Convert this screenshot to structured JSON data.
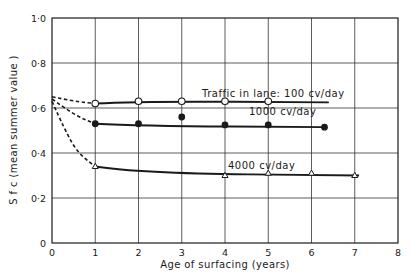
{
  "chart_data": {
    "type": "line",
    "title": "",
    "xlabel": "Age of surfacing (years)",
    "ylabel": "S f c (mean summer value )",
    "xlim": [
      0,
      8
    ],
    "ylim": [
      0,
      1.0
    ],
    "grid": true,
    "x_ticks": [
      "0",
      "1",
      "2",
      "3",
      "4",
      "5",
      "6",
      "7",
      "8"
    ],
    "y_ticks": [
      "0",
      "0·2",
      "0·4",
      "0·6",
      "0·8",
      "1·0"
    ],
    "legend": "none (inline annotations)",
    "series": [
      {
        "name": "Traffic in lane: 100 cv/day",
        "marker": "open-circle",
        "extrapolated_dashed": [
          [
            0,
            0.65
          ],
          [
            0.5,
            0.63
          ],
          [
            1,
            0.62
          ]
        ],
        "fitted_line": [
          [
            1,
            0.62
          ],
          [
            2,
            0.63
          ],
          [
            6.4,
            0.625
          ]
        ],
        "points": [
          [
            1,
            0.62
          ],
          [
            2,
            0.63
          ],
          [
            3,
            0.63
          ],
          [
            4,
            0.63
          ],
          [
            5,
            0.63
          ]
        ]
      },
      {
        "name": "1000 cv/day",
        "marker": "filled-circle",
        "extrapolated_dashed": [
          [
            0,
            0.64
          ],
          [
            0.5,
            0.57
          ],
          [
            1,
            0.53
          ]
        ],
        "fitted_line": [
          [
            1,
            0.53
          ],
          [
            2,
            0.52
          ],
          [
            6.3,
            0.515
          ]
        ],
        "points": [
          [
            1,
            0.53
          ],
          [
            2,
            0.53
          ],
          [
            3,
            0.56
          ],
          [
            4,
            0.525
          ],
          [
            5,
            0.525
          ],
          [
            6.3,
            0.515
          ]
        ]
      },
      {
        "name": "4000 cv/day",
        "marker": "open-triangle",
        "extrapolated_dashed": [
          [
            0,
            0.63
          ],
          [
            0.3,
            0.5
          ],
          [
            0.6,
            0.4
          ],
          [
            1,
            0.34
          ]
        ],
        "fitted_line": [
          [
            1,
            0.34
          ],
          [
            2,
            0.31
          ],
          [
            7.1,
            0.3
          ]
        ],
        "points": [
          [
            1,
            0.34
          ],
          [
            4,
            0.3
          ],
          [
            5,
            0.31
          ],
          [
            6,
            0.31
          ],
          [
            7,
            0.3
          ]
        ]
      }
    ],
    "annotations": [
      {
        "text": "Traffic in lane: 100 cv/day",
        "x": 3.45,
        "y": 0.65
      },
      {
        "text": "1000 cv/day",
        "x": 4.55,
        "y": 0.565
      },
      {
        "text": "4000 cv/day",
        "x": 3.95,
        "y": 0.34
      }
    ]
  },
  "labels": {
    "xlabel": "Age of surfacing (years)",
    "ylabel": "S f c (mean summer value )",
    "annot_100": "Traffic in lane: 100 cv/day",
    "annot_1000": "1000 cv/day",
    "annot_4000": "4000 cv/day"
  },
  "colors": {
    "ink": "#1a1a1a",
    "grid": "#333333",
    "background": "#ffffff"
  }
}
